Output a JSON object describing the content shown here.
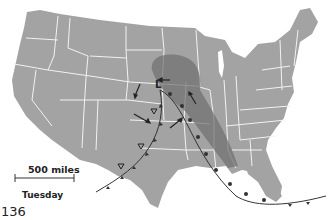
{
  "map": {
    "title": "US weather map",
    "scale_label": "500 miles",
    "day_label": "Tuesday",
    "page_number": "136",
    "low_pressure_label": "L",
    "colors": {
      "land": "#a3a3a3",
      "state_border": "#f2f2f2",
      "rain_shade": "#6e6e6e",
      "front_line": "#333333"
    }
  }
}
